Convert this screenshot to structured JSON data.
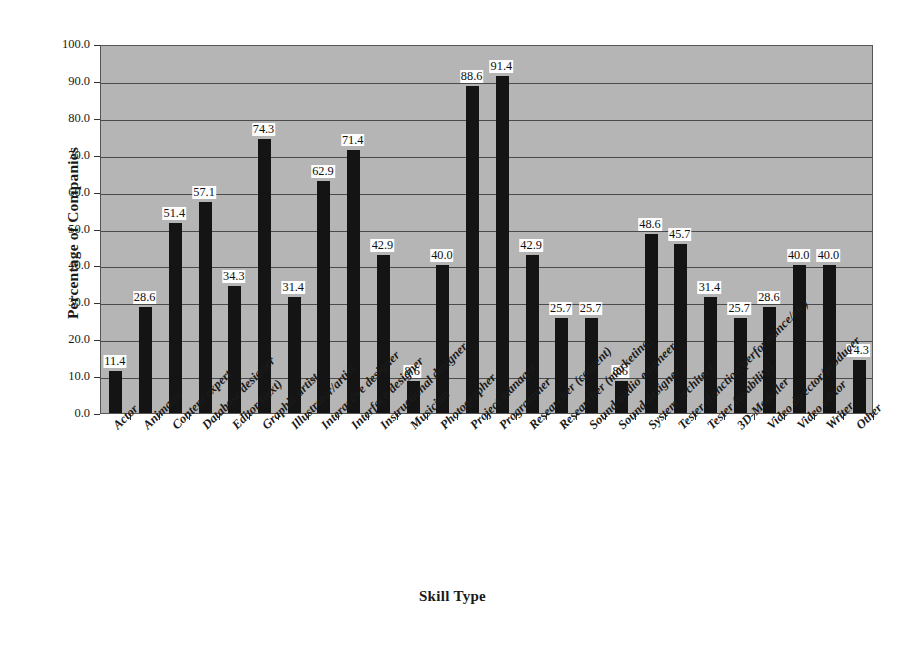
{
  "chart_data": {
    "type": "bar",
    "title": "",
    "subtitle": "",
    "xlabel": "Skill Type",
    "ylabel": "Percentage of Companies",
    "ylim": [
      0,
      100
    ],
    "yticks": [
      "0.0",
      "10.0",
      "20.0",
      "30.0",
      "40.0",
      "50.0",
      "60.0",
      "70.0",
      "80.0",
      "90.0",
      "100.0"
    ],
    "ytick_values": [
      0,
      10,
      20,
      30,
      40,
      50,
      60,
      70,
      80,
      90,
      100
    ],
    "grid": true,
    "legend": false,
    "legend_position": "none",
    "bar_color": "#141414",
    "plot_background": "#b5b5b5",
    "gridline_color": "#4a4a4a",
    "categories": [
      "Actor",
      "Animator",
      "Content expert",
      "Database designer",
      "Editor (text)",
      "Graphic artist",
      "Illustrator/artist",
      "Interactive designer",
      "Interface designer",
      "Instructional designer",
      "Musician",
      "Photographer",
      "Project manager",
      "Programmer",
      "Researcher (content)",
      "Researcher (marketing)",
      "Sound/audio engineer",
      "Sound designer",
      "System architect",
      "Tester (function/performance/etc)",
      "Tester (usability)",
      "3D-Modeller",
      "Video director/producer",
      "Video editor",
      "Writer",
      "Other"
    ],
    "values": [
      11.4,
      28.6,
      51.4,
      57.1,
      34.3,
      74.3,
      31.4,
      62.9,
      71.4,
      42.9,
      8.6,
      40.0,
      88.6,
      91.4,
      42.9,
      25.7,
      25.7,
      8.6,
      48.6,
      45.7,
      31.4,
      25.7,
      28.6,
      40.0,
      40.0,
      14.3
    ],
    "value_labels": [
      "11.4",
      "28.6",
      "51.4",
      "57.1",
      "34.3",
      "74.3",
      "31.4",
      "62.9",
      "71.4",
      "42.9",
      "8.6",
      "40.0",
      "88.6",
      "91.4",
      "42.9",
      "25.7",
      "25.7",
      "8.6",
      "48.6",
      "45.7",
      "31.4",
      "25.7",
      "28.6",
      "40.0",
      "40.0",
      "14.3"
    ]
  }
}
